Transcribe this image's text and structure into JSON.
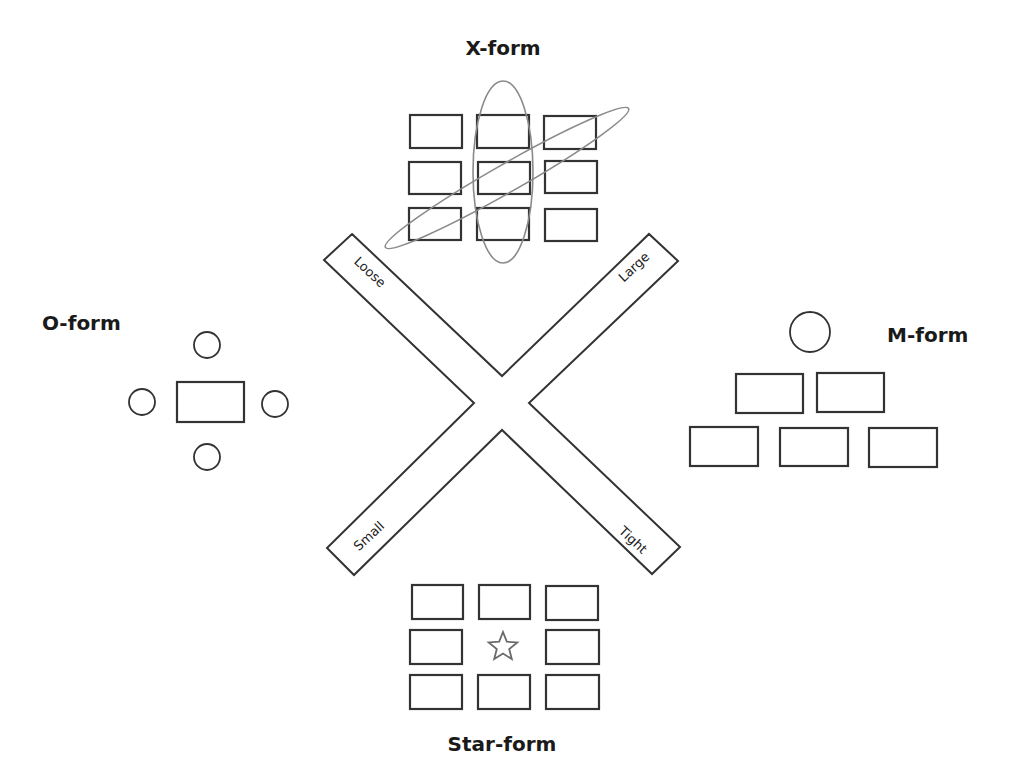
{
  "diagram": {
    "center": {
      "shape": "x-cross",
      "polygon": [
        [
          352,
          234
        ],
        [
          502,
          376
        ],
        [
          649,
          234
        ],
        [
          678,
          261
        ],
        [
          529,
          403
        ],
        [
          680,
          547
        ],
        [
          652,
          574
        ],
        [
          502,
          430
        ],
        [
          354,
          575
        ],
        [
          327,
          548
        ],
        [
          474,
          403
        ],
        [
          324,
          260
        ]
      ],
      "axis_labels": [
        {
          "id": "loose",
          "text": "Loose",
          "x": 370,
          "y": 272,
          "angle": 43
        },
        {
          "id": "large",
          "text": "Large",
          "x": 634,
          "y": 267,
          "angle": -43
        },
        {
          "id": "small",
          "text": "Small",
          "x": 369,
          "y": 536,
          "angle": -43
        },
        {
          "id": "tight",
          "text": "Tight",
          "x": 633,
          "y": 540,
          "angle": 43
        }
      ]
    },
    "forms": {
      "x_form": {
        "label": "X-form",
        "label_pos": [
          503,
          55
        ],
        "boxes": [
          [
            410,
            115,
            52,
            33
          ],
          [
            477,
            115,
            52,
            33
          ],
          [
            544,
            116,
            52,
            33
          ],
          [
            409,
            162,
            52,
            32
          ],
          [
            478,
            162,
            52,
            32
          ],
          [
            545,
            161,
            52,
            32
          ],
          [
            409,
            208,
            52,
            32
          ],
          [
            477,
            208,
            52,
            32
          ],
          [
            545,
            209,
            52,
            32
          ]
        ],
        "ellipses": [
          {
            "cx": 503,
            "cy": 172,
            "rx": 30,
            "ry": 91,
            "angle": 0
          },
          {
            "cx": 507,
            "cy": 178,
            "rx": 140,
            "ry": 14,
            "angle": -29.7
          }
        ]
      },
      "o_form": {
        "label": "O-form",
        "label_pos": [
          42,
          330
        ],
        "table": [
          177,
          382,
          67,
          40
        ],
        "seats": [
          [
            207,
            345,
            13
          ],
          [
            142,
            402,
            13
          ],
          [
            275,
            404,
            13
          ],
          [
            207,
            457,
            13
          ]
        ]
      },
      "m_form": {
        "label": "M-form",
        "label_pos": [
          887,
          342
        ],
        "head": [
          810,
          332,
          20
        ],
        "boxes": [
          [
            736,
            374,
            67,
            39
          ],
          [
            817,
            373,
            67,
            39
          ],
          [
            690,
            427,
            68,
            39
          ],
          [
            780,
            428,
            68,
            38
          ],
          [
            869,
            428,
            68,
            39
          ]
        ]
      },
      "star_form": {
        "label": "Star-form",
        "label_pos": [
          502,
          751
        ],
        "boxes": [
          [
            412,
            585,
            51,
            34
          ],
          [
            479,
            585,
            51,
            34
          ],
          [
            546,
            586,
            52,
            34
          ],
          [
            410,
            630,
            52,
            34
          ],
          [
            546,
            630,
            53,
            34
          ],
          [
            410,
            675,
            52,
            34
          ],
          [
            478,
            675,
            52,
            34
          ],
          [
            546,
            675,
            53,
            34
          ]
        ],
        "star": {
          "cx": 503,
          "cy": 647,
          "r_outer": 15,
          "r_inner": 6.5
        }
      }
    },
    "colors": {
      "stroke": "#333333",
      "ellipse": "#8a8a8a",
      "star": "#6a6a6a",
      "text": "#1a1a1a",
      "background": "#ffffff"
    }
  }
}
